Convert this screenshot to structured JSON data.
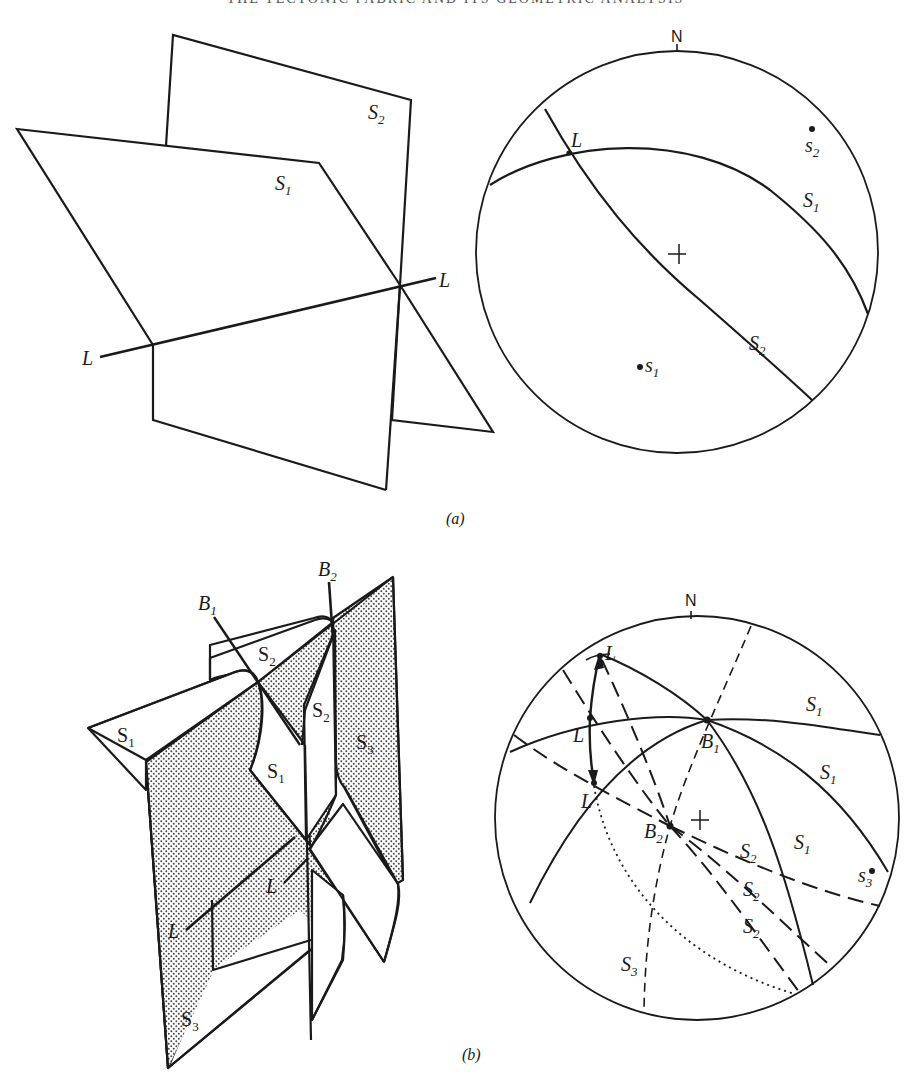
{
  "page": {
    "running_head": "THE TECTONIC FABRIC AND ITS GEOMETRIC ANALYSIS"
  },
  "figure_a": {
    "caption": "(a)",
    "block_diagram": {
      "planes": [
        {
          "label": "S",
          "sub": "1"
        },
        {
          "label": "S",
          "sub": "2"
        }
      ],
      "lineation": {
        "label_left": "L",
        "label_right": "L"
      }
    },
    "stereonet": {
      "north_label": "N",
      "center_mark": "+",
      "great_circles": [
        {
          "label": "S",
          "sub": "1"
        },
        {
          "label": "S",
          "sub": "2"
        }
      ],
      "poles": [
        {
          "label": "s",
          "sub": "1"
        },
        {
          "label": "s",
          "sub": "2"
        }
      ],
      "intersection": {
        "label": "L"
      }
    }
  },
  "figure_b": {
    "caption": "(b)",
    "block_diagram": {
      "fold_axes": [
        {
          "label": "B",
          "sub": "1"
        },
        {
          "label": "B",
          "sub": "2"
        }
      ],
      "surfaces": [
        {
          "label": "S",
          "sub": "1"
        },
        {
          "label": "S",
          "sub": "1"
        },
        {
          "label": "S",
          "sub": "2"
        },
        {
          "label": "S",
          "sub": "2"
        },
        {
          "label": "S",
          "sub": "3"
        },
        {
          "label": "S",
          "sub": "3"
        }
      ],
      "lineations": [
        {
          "label": "L"
        },
        {
          "label": "L"
        }
      ]
    },
    "stereonet": {
      "north_label": "N",
      "center_mark": "+",
      "great_circles_S1": [
        {
          "label": "S",
          "sub": "1"
        },
        {
          "label": "S",
          "sub": "1"
        },
        {
          "label": "S",
          "sub": "1"
        }
      ],
      "great_circles_S2": [
        {
          "label": "S",
          "sub": "2"
        },
        {
          "label": "S",
          "sub": "2"
        },
        {
          "label": "S",
          "sub": "2"
        }
      ],
      "great_circle_S3": {
        "label": "S",
        "sub": "3"
      },
      "poles": [
        {
          "label": "s",
          "sub": "3"
        }
      ],
      "axes": [
        {
          "label": "B",
          "sub": "1"
        },
        {
          "label": "B",
          "sub": "2"
        }
      ],
      "lineation_points": [
        {
          "label": "L"
        },
        {
          "label": "L"
        },
        {
          "label": "L"
        }
      ]
    }
  }
}
